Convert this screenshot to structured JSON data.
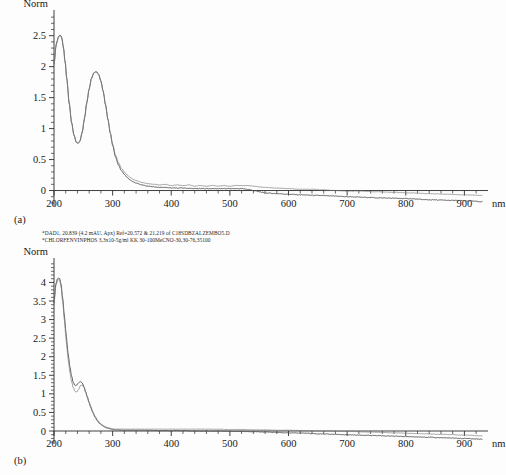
{
  "figure": {
    "panel_a_label": "(a)",
    "panel_b_label": "(b)"
  },
  "caption": {
    "line1": "*DAD1, 20.839 (4.2 mAU, Apx) Ref=20.572 & 21.219 of C18SDBZALZEMBO5.D",
    "line2": "*CHLORFENVINPHOS 3,3x10-5g/ml KK 30-100MeCNO-30,30-76,35100"
  },
  "chart_data": [
    {
      "id": "panel-a",
      "type": "line",
      "title": "",
      "ylabel": "Norm",
      "xlabel": "nm",
      "xlim": [
        200,
        930
      ],
      "ylim": [
        -0.25,
        2.85
      ],
      "grid": false,
      "legend": "none",
      "x_ticks": [
        200,
        300,
        400,
        500,
        600,
        700,
        800,
        900
      ],
      "x_tick_labels": [
        "200",
        "300",
        "400",
        "500",
        "600",
        "700",
        "800",
        "900"
      ],
      "x_minor_step": 20,
      "y_ticks": [
        0,
        0.5,
        1,
        1.5,
        2,
        2.5
      ],
      "y_tick_labels": [
        "0",
        "0.5",
        "1",
        "1.5",
        "2",
        "2.5"
      ],
      "y_minor_step": 0.1,
      "series": [
        {
          "name": "sample",
          "x": [
            200,
            204,
            208,
            210,
            212,
            214,
            216,
            219,
            222,
            226,
            230,
            234,
            238,
            241,
            244,
            248,
            252,
            256,
            260,
            264,
            268,
            272,
            276,
            280,
            284,
            288,
            292,
            296,
            300,
            305,
            310,
            315,
            320,
            325,
            330,
            335,
            340,
            350,
            360,
            370,
            380,
            390,
            400,
            420,
            440,
            460,
            480,
            500,
            520,
            530,
            540,
            550,
            560,
            580,
            600,
            620,
            650,
            680,
            700,
            730,
            760,
            800,
            840,
            880,
            910,
            930
          ],
          "y": [
            2.05,
            2.38,
            2.49,
            2.51,
            2.5,
            2.44,
            2.32,
            2.08,
            1.79,
            1.41,
            1.1,
            0.9,
            0.78,
            0.76,
            0.79,
            0.93,
            1.16,
            1.42,
            1.64,
            1.81,
            1.9,
            1.92,
            1.88,
            1.77,
            1.6,
            1.38,
            1.15,
            0.93,
            0.73,
            0.54,
            0.41,
            0.32,
            0.26,
            0.21,
            0.17,
            0.14,
            0.12,
            0.09,
            0.07,
            0.06,
            0.05,
            0.05,
            0.04,
            0.04,
            0.03,
            0.03,
            0.03,
            0.03,
            0.03,
            0.02,
            0.0,
            -0.02,
            -0.04,
            -0.05,
            -0.06,
            -0.07,
            -0.08,
            -0.09,
            -0.1,
            -0.11,
            -0.12,
            -0.13,
            -0.15,
            -0.16,
            -0.17,
            -0.18
          ]
        },
        {
          "name": "reference",
          "x": [
            200,
            204,
            208,
            210,
            212,
            214,
            216,
            219,
            222,
            226,
            230,
            234,
            238,
            241,
            244,
            248,
            252,
            256,
            260,
            264,
            268,
            272,
            276,
            280,
            284,
            288,
            292,
            296,
            300,
            305,
            310,
            315,
            320,
            325,
            330,
            335,
            340,
            350,
            360,
            370,
            380,
            390,
            400,
            410,
            420,
            430,
            440,
            450,
            460,
            470,
            480,
            490,
            500,
            510,
            520,
            530,
            540,
            550,
            560,
            580,
            600,
            620,
            640,
            660,
            680,
            700,
            720,
            750,
            780,
            810,
            840,
            870,
            900,
            930
          ],
          "y": [
            2.02,
            2.36,
            2.48,
            2.5,
            2.48,
            2.42,
            2.3,
            2.06,
            1.77,
            1.39,
            1.09,
            0.89,
            0.78,
            0.76,
            0.8,
            0.94,
            1.17,
            1.43,
            1.65,
            1.82,
            1.9,
            1.92,
            1.87,
            1.76,
            1.59,
            1.37,
            1.14,
            0.93,
            0.75,
            0.57,
            0.45,
            0.36,
            0.3,
            0.25,
            0.21,
            0.18,
            0.16,
            0.13,
            0.11,
            0.1,
            0.09,
            0.1,
            0.08,
            0.09,
            0.08,
            0.09,
            0.07,
            0.08,
            0.07,
            0.08,
            0.07,
            0.08,
            0.07,
            0.08,
            0.08,
            0.08,
            0.07,
            0.06,
            0.05,
            0.04,
            0.03,
            0.02,
            0.02,
            0.01,
            0.0,
            -0.01,
            -0.01,
            -0.02,
            -0.03,
            -0.04,
            -0.05,
            -0.06,
            -0.07,
            -0.08
          ]
        }
      ],
      "annotations": {
        "peak1_nm": 212,
        "peak1_value": 2.5,
        "trough_nm": 241,
        "trough_value": 0.76,
        "peak2_nm": 272,
        "peak2_value": 1.92
      }
    },
    {
      "id": "panel-b",
      "type": "line",
      "title": "",
      "ylabel": "Norm",
      "xlabel": "nm",
      "xlim": [
        200,
        930
      ],
      "ylim": [
        -0.35,
        4.55
      ],
      "grid": false,
      "legend": "none",
      "x_ticks": [
        200,
        300,
        400,
        500,
        600,
        700,
        800,
        900
      ],
      "x_tick_labels": [
        "200",
        "300",
        "400",
        "500",
        "600",
        "700",
        "800",
        "900"
      ],
      "x_minor_step": 20,
      "y_ticks": [
        0,
        0.5,
        1,
        1.5,
        2,
        2.5,
        3,
        3.5,
        4
      ],
      "y_tick_labels": [
        "0",
        "0.5",
        "1",
        "1.5",
        "2",
        "2.5",
        "3",
        "3.5",
        "4"
      ],
      "y_minor_step": 0.1,
      "series": [
        {
          "name": "sample",
          "x": [
            200,
            203,
            206,
            208,
            210,
            212,
            215,
            218,
            221,
            224,
            227,
            230,
            233,
            236,
            239,
            242,
            245,
            248,
            251,
            254,
            257,
            260,
            263,
            266,
            270,
            274,
            278,
            282,
            286,
            290,
            295,
            300,
            305,
            310,
            320,
            330,
            340,
            350,
            360,
            380,
            400,
            420,
            440,
            460,
            480,
            500,
            520,
            540,
            560,
            580,
            600,
            630,
            660,
            700,
            740,
            780,
            820,
            860,
            900,
            930
          ],
          "y": [
            3.45,
            3.95,
            4.1,
            4.12,
            4.1,
            3.95,
            3.55,
            3.05,
            2.55,
            2.1,
            1.75,
            1.48,
            1.3,
            1.22,
            1.24,
            1.3,
            1.33,
            1.3,
            1.2,
            1.05,
            0.9,
            0.75,
            0.62,
            0.5,
            0.37,
            0.27,
            0.2,
            0.15,
            0.11,
            0.08,
            0.06,
            0.04,
            0.03,
            0.03,
            0.02,
            0.02,
            0.02,
            0.02,
            0.02,
            0.01,
            0.01,
            0.01,
            0.0,
            0.0,
            0.0,
            -0.01,
            -0.01,
            -0.02,
            -0.03,
            -0.04,
            -0.05,
            -0.06,
            -0.08,
            -0.1,
            -0.12,
            -0.14,
            -0.16,
            -0.18,
            -0.2,
            -0.22
          ]
        },
        {
          "name": "reference",
          "x": [
            200,
            203,
            206,
            208,
            210,
            212,
            215,
            218,
            221,
            224,
            227,
            230,
            233,
            236,
            239,
            242,
            245,
            248,
            251,
            254,
            257,
            260,
            263,
            266,
            270,
            274,
            278,
            282,
            286,
            290,
            295,
            300,
            305,
            310,
            320,
            330,
            340,
            350,
            360,
            380,
            400,
            420,
            440,
            460,
            480,
            500,
            520,
            540,
            560,
            580,
            600,
            630,
            660,
            700,
            740,
            780,
            820,
            860,
            900,
            930
          ],
          "y": [
            3.38,
            3.9,
            4.05,
            4.08,
            4.05,
            3.88,
            3.45,
            2.92,
            2.4,
            1.95,
            1.6,
            1.33,
            1.16,
            1.06,
            1.05,
            1.12,
            1.22,
            1.24,
            1.18,
            1.05,
            0.92,
            0.78,
            0.65,
            0.53,
            0.4,
            0.3,
            0.22,
            0.17,
            0.13,
            0.1,
            0.08,
            0.06,
            0.05,
            0.05,
            0.05,
            0.05,
            0.05,
            0.05,
            0.05,
            0.05,
            0.05,
            0.05,
            0.05,
            0.05,
            0.05,
            0.04,
            0.04,
            0.03,
            0.03,
            0.02,
            0.02,
            0.01,
            0.0,
            -0.01,
            -0.03,
            -0.05,
            -0.07,
            -0.09,
            -0.11,
            -0.13
          ]
        }
      ],
      "annotations": {
        "peak1_nm": 209,
        "peak1_value": 4.12,
        "shoulder_nm": 245,
        "shoulder_value": 1.33
      }
    }
  ]
}
